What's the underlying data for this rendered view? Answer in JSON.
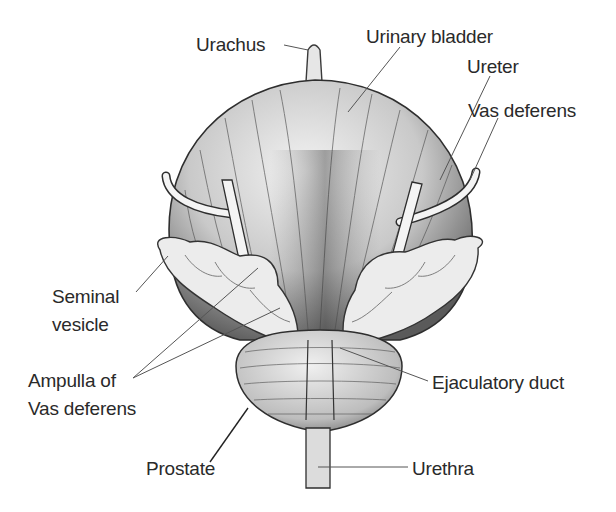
{
  "diagram": {
    "type": "anatomical illustration",
    "labels": [
      {
        "id": "urachus",
        "text": "Urachus",
        "x": 196,
        "y": 34
      },
      {
        "id": "urinary-bladder",
        "text": "Urinary bladder",
        "x": 366,
        "y": 26
      },
      {
        "id": "ureter",
        "text": "Ureter",
        "x": 467,
        "y": 56
      },
      {
        "id": "vas-deferens",
        "text": "Vas deferens",
        "x": 468,
        "y": 100
      },
      {
        "id": "seminal-vesicle-1",
        "text": "Seminal",
        "x": 52,
        "y": 286
      },
      {
        "id": "seminal-vesicle-2",
        "text": "vesicle",
        "x": 52,
        "y": 314
      },
      {
        "id": "ampulla-1",
        "text": "Ampulla of",
        "x": 28,
        "y": 370
      },
      {
        "id": "ampulla-2",
        "text": "Vas deferens",
        "x": 28,
        "y": 398
      },
      {
        "id": "ejaculatory-duct",
        "text": "Ejaculatory duct",
        "x": 432,
        "y": 372
      },
      {
        "id": "prostate",
        "text": "Prostate",
        "x": 146,
        "y": 458
      },
      {
        "id": "urethra",
        "text": "Urethra",
        "x": 412,
        "y": 458
      }
    ]
  }
}
